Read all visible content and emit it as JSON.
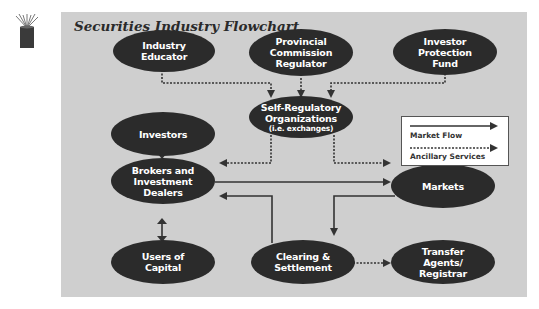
{
  "title": "Securities Industry Flowchart",
  "nodes": {
    "industry_educator": "Industry\nEducator",
    "provincial_regulator": "Provincial\nCommission\nRegulator",
    "investor_protection": "Investor\nProtection\nFund",
    "investors": "Investors",
    "sro": "Self-Regulatory\nOrganizations",
    "sro_sub": "(i.e. exchanges)",
    "brokers": "Brokers and\nInvestment\nDealers",
    "markets": "Markets",
    "users_of_capital": "Users of\nCapital",
    "clearing": "Clearing &\nSettlement",
    "transfer_agents": "Transfer\nAgents/\nRegistrar"
  },
  "legend": {
    "market_flow": "Market Flow",
    "ancillary": "Ancillary Services"
  },
  "colors": {
    "panel": "#cfcfcf",
    "node": "#2b2b2b",
    "line": "#333333"
  }
}
